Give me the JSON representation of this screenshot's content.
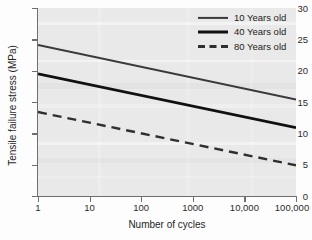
{
  "chart_data": {
    "type": "line",
    "title": "",
    "xlabel": "Number of cycles",
    "ylabel": "Tensile failure stress (MPa)",
    "xscale": "log",
    "xlim": [
      1,
      100000
    ],
    "ylim": [
      0,
      30
    ],
    "xticks": [
      1,
      10,
      100,
      1000,
      10000,
      100000
    ],
    "xtick_labels": [
      "1",
      "10",
      "100",
      "1000",
      "10,000",
      "100,000"
    ],
    "yticks": [
      0,
      5,
      10,
      15,
      20,
      25,
      30
    ],
    "ytick_labels": [
      "0",
      "5",
      "10",
      "15",
      "20",
      "25",
      "30"
    ],
    "grid": false,
    "legend_position": "top-right",
    "x": [
      1,
      100000
    ],
    "series": [
      {
        "name": "10 Years old",
        "values": [
          24.1,
          15.4
        ],
        "style": "solid",
        "color": "#3a3a3a",
        "width": 2.1
      },
      {
        "name": "40 Years old",
        "values": [
          19.5,
          10.9
        ],
        "style": "solid",
        "color": "#111111",
        "width": 2.6
      },
      {
        "name": "80 Years old",
        "values": [
          13.4,
          4.9
        ],
        "style": "dashed",
        "color": "#2f2f2f",
        "width": 2.4
      }
    ]
  },
  "legend": {
    "items": [
      {
        "label": "10 Years old",
        "style": "solid",
        "color": "#3a3a3a",
        "width": 2.1
      },
      {
        "label": "40 Years old",
        "style": "solid",
        "color": "#111111",
        "width": 2.8
      },
      {
        "label": "80 Years old",
        "style": "dashed",
        "color": "#2f2f2f",
        "width": 2.6
      }
    ]
  },
  "colors": {
    "plot_background": "#e9e9e9",
    "figure_background": "#fdfdfd",
    "axis": "#6f6f6f",
    "text": "#1f1f1f"
  }
}
